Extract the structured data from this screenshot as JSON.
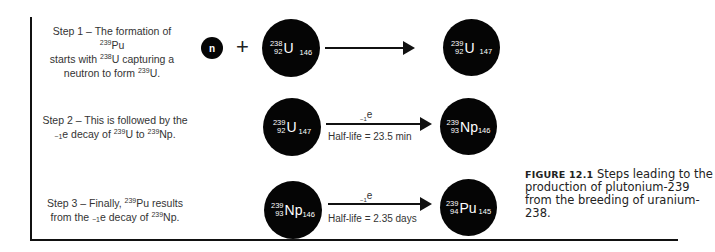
{
  "steps": [
    {
      "label": "Step 1",
      "line1_prefix": "Step 1 – The formation of ",
      "line1_iso_mass": "239",
      "line1_iso_sym": "Pu",
      "line2_prefix": "starts with ",
      "line2_iso_mass": "238",
      "line2_iso_sym": "U capturing a",
      "line3_prefix": "neutron to form ",
      "line3_iso_mass": "239",
      "line3_iso_sym": "U."
    },
    {
      "label": "Step 2",
      "line1": "Step 2 – This is followed by the",
      "line2_sub": "−1",
      "line2_a": "e decay of ",
      "line2_m1": "239",
      "line2_s1": "U to ",
      "line2_m2": "239",
      "line2_s2": "Np."
    },
    {
      "label": "Step 3",
      "line1_prefix": "Step 3 – Finally, ",
      "line1_mass": "239",
      "line1_rest": "Pu results",
      "line2_a": "from the ",
      "line2_sub": "−1",
      "line2_b": "e decay of ",
      "line2_mass": "239",
      "line2_rest": "Np."
    }
  ],
  "reactions": {
    "r1": {
      "neutron": "n",
      "plus": "+",
      "reactant": {
        "mass": "238",
        "z": "92",
        "symbol": "U",
        "n": "146"
      },
      "product": {
        "mass": "239",
        "z": "92",
        "symbol": "U",
        "n": "147"
      }
    },
    "r2": {
      "reactant": {
        "mass": "239",
        "z": "92",
        "symbol": "U",
        "n": "147"
      },
      "particle_sub": "−1",
      "particle": "e",
      "half_life": "Half-life = 23.5 min",
      "product": {
        "mass": "239",
        "z": "93",
        "symbol": "Np",
        "n": "146"
      }
    },
    "r3": {
      "reactant": {
        "mass": "239",
        "z": "93",
        "symbol": "Np",
        "n": "146"
      },
      "particle_sub": "−1",
      "particle": "e",
      "half_life": "Half-life = 2.35 days",
      "product": {
        "mass": "239",
        "z": "94",
        "symbol": "Pu",
        "n": "145"
      }
    }
  },
  "caption": {
    "label": "FIGURE 12.1",
    "text": "Steps leading to the production of plutonium-239 from the breeding of uranium-238."
  }
}
